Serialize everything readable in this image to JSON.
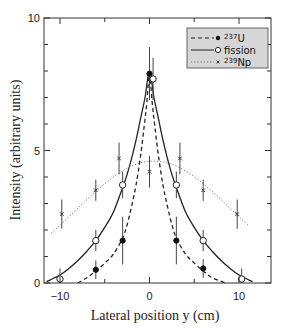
{
  "chart_data": {
    "type": "scatter",
    "title": "",
    "xlabel": "Lateral position y (cm)",
    "ylabel": "Intensity (arbitrary units)",
    "xlim": [
      -11.8,
      13.6
    ],
    "ylim": [
      0,
      10
    ],
    "x_ticks": [
      -10,
      0,
      10
    ],
    "x_tick_labels": [
      "−10",
      "0",
      "10"
    ],
    "x_minor_ticks": [
      -5,
      5
    ],
    "y_ticks": [
      0,
      5,
      10
    ],
    "y_tick_labels": [
      "0",
      "5",
      "10"
    ],
    "y_minor_ticks": [
      1,
      2,
      3,
      4,
      6,
      7,
      8,
      9
    ],
    "grid": false,
    "legend_position": "upper right",
    "series": [
      {
        "name": "237U",
        "legend_label_sup": "237",
        "legend_label_base": "U",
        "marker": "filled-circle",
        "line_style": "dashed",
        "points": [
          {
            "x": -6,
            "y": 0.5,
            "err": 0.35
          },
          {
            "x": -3,
            "y": 1.6,
            "err": 0.9
          },
          {
            "x": 0,
            "y": 7.9,
            "err": 1.0
          },
          {
            "x": 3,
            "y": 1.6,
            "err": 0.9
          },
          {
            "x": 6,
            "y": 0.55,
            "err": 0.35
          }
        ],
        "curve": [
          [
            -8,
            0
          ],
          [
            -7,
            0.2
          ],
          [
            -6,
            0.45
          ],
          [
            -5,
            0.75
          ],
          [
            -4,
            1.1
          ],
          [
            -3,
            1.7
          ],
          [
            -2.5,
            2.2
          ],
          [
            -2,
            2.9
          ],
          [
            -1.5,
            3.7
          ],
          [
            -1,
            4.8
          ],
          [
            -0.6,
            5.9
          ],
          [
            -0.3,
            6.8
          ],
          [
            0,
            7.9
          ],
          [
            0.3,
            6.8
          ],
          [
            0.6,
            5.9
          ],
          [
            1,
            4.8
          ],
          [
            1.5,
            3.7
          ],
          [
            2,
            2.9
          ],
          [
            2.5,
            2.2
          ],
          [
            3,
            1.7
          ],
          [
            4,
            1.1
          ],
          [
            5,
            0.75
          ],
          [
            6,
            0.45
          ],
          [
            7,
            0.2
          ],
          [
            8.5,
            0
          ]
        ]
      },
      {
        "name": "fission",
        "legend_label_sup": "",
        "legend_label_base": "fission",
        "marker": "open-circle",
        "line_style": "solid",
        "points": [
          {
            "x": -10,
            "y": 0.15,
            "err": 0.4
          },
          {
            "x": -6,
            "y": 1.6,
            "err": 0.4
          },
          {
            "x": -3,
            "y": 3.7,
            "err": 0.5
          },
          {
            "x": 0.4,
            "y": 7.7,
            "err": 0.8
          },
          {
            "x": 3,
            "y": 3.7,
            "err": 0.5
          },
          {
            "x": 6,
            "y": 1.6,
            "err": 0.4
          },
          {
            "x": 10.3,
            "y": 0.15,
            "err": 0.4
          }
        ],
        "curve": [
          [
            -11.5,
            0.05
          ],
          [
            -10,
            0.3
          ],
          [
            -9,
            0.55
          ],
          [
            -8,
            0.85
          ],
          [
            -7,
            1.2
          ],
          [
            -6,
            1.6
          ],
          [
            -5,
            2.1
          ],
          [
            -4,
            2.7
          ],
          [
            -3,
            3.6
          ],
          [
            -2.5,
            4.1
          ],
          [
            -2,
            4.7
          ],
          [
            -1.5,
            5.4
          ],
          [
            -1,
            6.2
          ],
          [
            -0.5,
            7.0
          ],
          [
            0,
            8.0
          ],
          [
            0.5,
            7.0
          ],
          [
            1,
            6.2
          ],
          [
            1.5,
            5.4
          ],
          [
            2,
            4.7
          ],
          [
            2.5,
            4.1
          ],
          [
            3,
            3.6
          ],
          [
            4,
            2.7
          ],
          [
            5,
            2.1
          ],
          [
            6,
            1.6
          ],
          [
            7,
            1.2
          ],
          [
            8,
            0.85
          ],
          [
            9,
            0.55
          ],
          [
            10,
            0.3
          ],
          [
            11.5,
            0.05
          ]
        ]
      },
      {
        "name": "239Np",
        "legend_label_sup": "239",
        "legend_label_base": "Np",
        "marker": "cross",
        "line_style": "dotted",
        "points": [
          {
            "x": -9.8,
            "y": 2.6,
            "err": 0.55
          },
          {
            "x": -6,
            "y": 3.5,
            "err": 0.4
          },
          {
            "x": -3.4,
            "y": 4.7,
            "err": 0.6
          },
          {
            "x": 0,
            "y": 4.2,
            "err": 0.6
          },
          {
            "x": 3.4,
            "y": 4.7,
            "err": 0.6
          },
          {
            "x": 6,
            "y": 3.5,
            "err": 0.4
          },
          {
            "x": 9.8,
            "y": 2.6,
            "err": 0.55
          }
        ],
        "curve_gaussian": {
          "amplitude": 4.6,
          "center": 0.5,
          "sigma": 8.6,
          "x_from": -11,
          "x_to": 11.2
        }
      }
    ]
  },
  "colors": {
    "axis": "#333333",
    "line": "#222222",
    "legend_fill": "#d6d6d6",
    "background": "#ffffff"
  }
}
